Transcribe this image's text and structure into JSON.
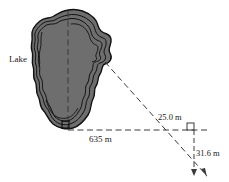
{
  "figure": {
    "background_color": "#ffffff",
    "lake": {
      "label": "Lake",
      "fill_color": "#6e6e6e",
      "outline_color": "#111111",
      "contour_color": "#111111"
    },
    "labels": {
      "lake": "Lake",
      "baseline": "635 m",
      "short_leg": "25.0 m",
      "vertical_leg": "31.6 m"
    },
    "measurements": [
      {
        "name": "lake-width-baseline",
        "value": "635 m",
        "numeric": 635,
        "unit": "m"
      },
      {
        "name": "offset-horizontal",
        "value": "25.0 m",
        "numeric": 25.0,
        "unit": "m"
      },
      {
        "name": "offset-vertical",
        "value": "31.6 m",
        "numeric": 31.6,
        "unit": "m"
      }
    ],
    "markers": {
      "right_angle_lake": "right-angle",
      "right_angle_corner": "right-angle"
    },
    "line_style": {
      "color": "#3a3a3a",
      "dash": "5,3"
    }
  }
}
